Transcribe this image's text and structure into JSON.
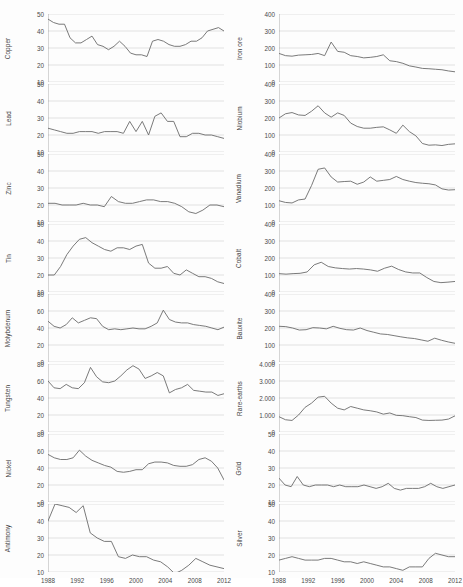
{
  "figure": {
    "title": "",
    "background": "#fdfdfd",
    "line_color": "#6b6b6b",
    "grid_color": "#d2d2d2",
    "axis_color": "#8a8a8a",
    "text_color": "#3f3f3f"
  },
  "axis": {
    "xticks": [
      "1988",
      "1992",
      "1996",
      "2000",
      "2004",
      "2008",
      "2012"
    ],
    "xmin": 1988,
    "xmax": 2012
  },
  "chart_data": [
    {
      "type": "line",
      "title": "Copper",
      "ylabel": "Copper",
      "xlabel": "",
      "grid": true,
      "legend": "none",
      "ylim": [
        10,
        50
      ],
      "yticks": [
        10,
        20,
        30,
        40,
        50
      ],
      "x": [
        1988,
        1989,
        1990,
        1991,
        1992,
        1993,
        1994,
        1995,
        1996,
        1997,
        1998,
        1999,
        2000,
        2001,
        2002,
        2003,
        2004,
        2005,
        2006,
        2007,
        2008,
        2009,
        2010,
        2011,
        2012
      ],
      "values": [
        47,
        45,
        44,
        44,
        36,
        33,
        33,
        35,
        37,
        32,
        31,
        29,
        31,
        34,
        31,
        27,
        26,
        26,
        25,
        34,
        35,
        34,
        32,
        31,
        31,
        32,
        34,
        34,
        36,
        40,
        41,
        42,
        40
      ]
    },
    {
      "type": "line",
      "title": "Lead",
      "ylabel": "Lead",
      "xlabel": "",
      "grid": true,
      "legend": "none",
      "ylim": [
        10,
        50
      ],
      "yticks": [
        10,
        20,
        30,
        40,
        50
      ],
      "x": [
        1988,
        1989,
        1990,
        1991,
        1992,
        1993,
        1994,
        1995,
        1996,
        1997,
        1998,
        1999,
        2000,
        2001,
        2002,
        2003,
        2004,
        2005,
        2006,
        2007,
        2008,
        2009,
        2010,
        2011,
        2012
      ],
      "values": [
        24,
        23,
        22,
        21,
        21,
        22,
        22,
        22,
        21,
        22,
        22,
        22,
        21,
        28,
        22,
        28,
        20,
        31,
        33,
        28,
        28,
        19,
        19,
        21,
        21,
        20,
        20,
        19,
        18
      ]
    },
    {
      "type": "line",
      "title": "Zinc",
      "ylabel": "Zinc",
      "xlabel": "",
      "grid": true,
      "legend": "none",
      "ylim": [
        10,
        50
      ],
      "yticks": [
        10,
        20,
        30,
        40,
        50
      ],
      "x": [
        1988,
        1989,
        1990,
        1991,
        1992,
        1993,
        1994,
        1995,
        1996,
        1997,
        1998,
        1999,
        2000,
        2001,
        2002,
        2003,
        2004,
        2005,
        2006,
        2007,
        2008,
        2009,
        2010,
        2011,
        2012
      ],
      "values": [
        21,
        21,
        20,
        20,
        20,
        21,
        20,
        20,
        19,
        25,
        22,
        21,
        21,
        22,
        23,
        23,
        22,
        22,
        21,
        19,
        16,
        15,
        17,
        20,
        20,
        19
      ]
    },
    {
      "type": "line",
      "title": "Tin",
      "ylabel": "Tin",
      "xlabel": "",
      "grid": true,
      "legend": "none",
      "ylim": [
        10,
        50
      ],
      "yticks": [
        10,
        20,
        30,
        40,
        50
      ],
      "x": [
        1988,
        1989,
        1990,
        1991,
        1992,
        1993,
        1994,
        1995,
        1996,
        1997,
        1998,
        1999,
        2000,
        2001,
        2002,
        2003,
        2004,
        2005,
        2006,
        2007,
        2008,
        2009,
        2010,
        2011,
        2012
      ],
      "values": [
        20,
        20,
        25,
        32,
        37,
        41,
        42,
        39,
        37,
        35,
        34,
        36,
        36,
        35,
        37,
        38,
        27,
        24,
        24,
        25,
        21,
        20,
        23,
        21,
        19,
        19,
        18,
        16,
        15
      ]
    },
    {
      "type": "line",
      "title": "Molybdenum",
      "ylabel": "Molybdenum",
      "xlabel": "",
      "grid": true,
      "legend": "none",
      "ylim": [
        0,
        80
      ],
      "yticks": [
        0,
        20,
        40,
        60,
        80
      ],
      "x": [
        1988,
        1989,
        1990,
        1991,
        1992,
        1993,
        1994,
        1995,
        1996,
        1997,
        1998,
        1999,
        2000,
        2001,
        2002,
        2003,
        2004,
        2005,
        2006,
        2007,
        2008,
        2009,
        2010,
        2011,
        2012
      ],
      "values": [
        48,
        42,
        40,
        44,
        52,
        46,
        49,
        52,
        51,
        42,
        38,
        39,
        38,
        39,
        40,
        39,
        39,
        42,
        46,
        61,
        50,
        47,
        46,
        46,
        44,
        43,
        42,
        40,
        38,
        41
      ]
    },
    {
      "type": "line",
      "title": "Tungsten",
      "ylabel": "Tungsten",
      "xlabel": "",
      "grid": true,
      "legend": "none",
      "ylim": [
        0,
        80
      ],
      "yticks": [
        0,
        20,
        40,
        60,
        80
      ],
      "x": [
        1988,
        1989,
        1990,
        1991,
        1992,
        1993,
        1994,
        1995,
        1996,
        1997,
        1998,
        1999,
        2000,
        2001,
        2002,
        2003,
        2004,
        2005,
        2006,
        2007,
        2008,
        2009,
        2010,
        2011,
        2012
      ],
      "values": [
        60,
        52,
        51,
        56,
        52,
        51,
        58,
        76,
        65,
        59,
        58,
        60,
        66,
        73,
        78,
        74,
        63,
        66,
        70,
        66,
        46,
        50,
        52,
        56,
        49,
        48,
        47,
        47,
        43,
        45
      ]
    },
    {
      "type": "line",
      "title": "Nickel",
      "ylabel": "Nickel",
      "xlabel": "",
      "grid": true,
      "legend": "none",
      "ylim": [
        0,
        80
      ],
      "yticks": [
        0,
        20,
        40,
        60,
        80
      ],
      "x": [
        1988,
        1989,
        1990,
        1991,
        1992,
        1993,
        1994,
        1995,
        1996,
        1997,
        1998,
        1999,
        2000,
        2001,
        2002,
        2003,
        2004,
        2005,
        2006,
        2007,
        2008,
        2009,
        2010,
        2011,
        2012
      ],
      "values": [
        56,
        52,
        50,
        50,
        52,
        61,
        54,
        49,
        46,
        43,
        41,
        36,
        35,
        36,
        38,
        38,
        45,
        47,
        47,
        46,
        43,
        42,
        42,
        44,
        50,
        52,
        48,
        40,
        26
      ]
    },
    {
      "type": "line",
      "title": "Antimony",
      "ylabel": "Antimony",
      "xlabel": "",
      "grid": true,
      "legend": "none",
      "ylim": [
        10,
        50
      ],
      "yticks": [
        10,
        20,
        30,
        40,
        50
      ],
      "x": [
        1988,
        1989,
        1990,
        1991,
        1992,
        1993,
        1994,
        1995,
        1996,
        1997,
        1998,
        1999,
        2000,
        2001,
        2002,
        2003,
        2004,
        2005,
        2006,
        2007,
        2008,
        2009,
        2010,
        2011,
        2012
      ],
      "values": [
        40,
        50,
        49,
        48,
        45,
        49,
        33,
        30,
        28,
        28,
        19,
        18,
        20,
        19,
        19,
        17,
        16,
        13,
        9,
        11,
        14,
        18,
        16,
        14,
        13,
        12
      ]
    },
    {
      "type": "line",
      "title": "Iron ore",
      "ylabel": "Iron ore",
      "xlabel": "",
      "grid": true,
      "legend": "none",
      "ylim": [
        0,
        400
      ],
      "yticks": [
        0,
        100,
        200,
        300,
        400
      ],
      "x": [
        1988,
        1989,
        1990,
        1991,
        1992,
        1993,
        1994,
        1995,
        1996,
        1997,
        1998,
        1999,
        2000,
        2001,
        2002,
        2003,
        2004,
        2005,
        2006,
        2007,
        2008,
        2009,
        2010,
        2011,
        2012
      ],
      "values": [
        168,
        155,
        152,
        158,
        160,
        162,
        168,
        155,
        235,
        180,
        175,
        155,
        150,
        142,
        145,
        150,
        160,
        125,
        120,
        110,
        95,
        88,
        80,
        78,
        75,
        72,
        65,
        60
      ]
    },
    {
      "type": "line",
      "title": "Niobium",
      "ylabel": "Niobium",
      "xlabel": "",
      "grid": true,
      "legend": "none",
      "ylim": [
        0,
        400
      ],
      "yticks": [
        0,
        100,
        200,
        300,
        400
      ],
      "x": [
        1988,
        1989,
        1990,
        1991,
        1992,
        1993,
        1994,
        1995,
        1996,
        1997,
        1998,
        1999,
        2000,
        2001,
        2002,
        2003,
        2004,
        2005,
        2006,
        2007,
        2008,
        2009,
        2010,
        2011,
        2012
      ],
      "values": [
        200,
        225,
        232,
        218,
        215,
        240,
        272,
        230,
        205,
        230,
        215,
        170,
        150,
        140,
        140,
        145,
        148,
        130,
        110,
        158,
        120,
        95,
        50,
        40,
        42,
        38,
        45,
        48
      ]
    },
    {
      "type": "line",
      "title": "Vanadium",
      "ylabel": "Vanadium",
      "xlabel": "",
      "grid": true,
      "legend": "none",
      "ylim": [
        0,
        400
      ],
      "yticks": [
        0,
        100,
        200,
        300,
        400
      ],
      "x": [
        1988,
        1989,
        1990,
        1991,
        1992,
        1993,
        1994,
        1995,
        1996,
        1997,
        1998,
        1999,
        2000,
        2001,
        2002,
        2003,
        2004,
        2005,
        2006,
        2007,
        2008,
        2009,
        2010,
        2011,
        2012
      ],
      "values": [
        125,
        115,
        112,
        130,
        135,
        215,
        310,
        318,
        265,
        235,
        238,
        240,
        222,
        235,
        265,
        240,
        245,
        250,
        268,
        250,
        240,
        232,
        228,
        225,
        218,
        195,
        188,
        190
      ]
    },
    {
      "type": "line",
      "title": "Cobalt",
      "ylabel": "Cobalt",
      "xlabel": "",
      "grid": true,
      "legend": "none",
      "ylim": [
        0,
        400
      ],
      "yticks": [
        0,
        100,
        200,
        300,
        400
      ],
      "x": [
        1988,
        1989,
        1990,
        1991,
        1992,
        1993,
        1994,
        1995,
        1996,
        1997,
        1998,
        1999,
        2000,
        2001,
        2002,
        2003,
        2004,
        2005,
        2006,
        2007,
        2008,
        2009,
        2010,
        2011,
        2012
      ],
      "values": [
        108,
        105,
        108,
        110,
        118,
        160,
        175,
        150,
        142,
        138,
        135,
        138,
        135,
        130,
        122,
        140,
        152,
        132,
        118,
        112,
        112,
        85,
        62,
        55,
        58,
        62
      ]
    },
    {
      "type": "line",
      "title": "Bauxite",
      "ylabel": "Bauxite",
      "xlabel": "",
      "grid": true,
      "legend": "none",
      "ylim": [
        0,
        400
      ],
      "yticks": [
        0,
        100,
        200,
        300,
        400
      ],
      "x": [
        1988,
        1989,
        1990,
        1991,
        1992,
        1993,
        1994,
        1995,
        1996,
        1997,
        1998,
        1999,
        2000,
        2001,
        2002,
        2003,
        2004,
        2005,
        2006,
        2007,
        2008,
        2009,
        2010,
        2011,
        2012
      ],
      "values": [
        210,
        208,
        200,
        188,
        190,
        202,
        200,
        195,
        210,
        198,
        190,
        188,
        200,
        185,
        175,
        165,
        162,
        155,
        148,
        142,
        138,
        130,
        122,
        140,
        128,
        118,
        110
      ]
    },
    {
      "type": "line",
      "title": "Rare-earths",
      "ylabel": "Rare-earths",
      "xlabel": "",
      "grid": true,
      "legend": "none",
      "ylim": [
        0,
        4000
      ],
      "yticks": [
        0,
        1000,
        2000,
        3000,
        4000
      ],
      "ytick_labels": [
        "0",
        "1.000",
        "2.000",
        "3.000",
        "4.000"
      ],
      "x": [
        1988,
        1989,
        1990,
        1991,
        1992,
        1993,
        1994,
        1995,
        1996,
        1997,
        1998,
        1999,
        2000,
        2001,
        2002,
        2003,
        2004,
        2005,
        2006,
        2007,
        2008,
        2009,
        2010,
        2011,
        2012
      ],
      "values": [
        900,
        720,
        680,
        1000,
        1450,
        1700,
        2050,
        2100,
        1700,
        1400,
        1300,
        1500,
        1400,
        1300,
        1250,
        1180,
        1050,
        1120,
        980,
        960,
        900,
        850,
        700,
        680,
        690,
        700,
        760,
        950
      ]
    },
    {
      "type": "line",
      "title": "Gold",
      "ylabel": "Gold",
      "xlabel": "",
      "grid": true,
      "legend": "none",
      "ylim": [
        10,
        50
      ],
      "yticks": [
        10,
        20,
        30,
        40,
        50
      ],
      "x": [
        1988,
        1989,
        1990,
        1991,
        1992,
        1993,
        1994,
        1995,
        1996,
        1997,
        1998,
        1999,
        2000,
        2001,
        2002,
        2003,
        2004,
        2005,
        2006,
        2007,
        2008,
        2009,
        2010,
        2011,
        2012
      ],
      "values": [
        24,
        20,
        19,
        25,
        20,
        19,
        20,
        20,
        20,
        19,
        20,
        19,
        19,
        19,
        20,
        19,
        18,
        19,
        21,
        18,
        17,
        18,
        18,
        18,
        19,
        21,
        19,
        18,
        19,
        20
      ]
    },
    {
      "type": "line",
      "title": "Silver",
      "ylabel": "Silver",
      "xlabel": "",
      "grid": true,
      "legend": "none",
      "ylim": [
        10,
        50
      ],
      "yticks": [
        10,
        20,
        30,
        40,
        50
      ],
      "x": [
        1988,
        1989,
        1990,
        1991,
        1992,
        1993,
        1994,
        1995,
        1996,
        1997,
        1998,
        1999,
        2000,
        2001,
        2002,
        2003,
        2004,
        2005,
        2006,
        2007,
        2008,
        2009,
        2010,
        2011,
        2012
      ],
      "values": [
        17,
        18,
        19,
        18,
        17,
        17,
        17,
        18,
        18,
        17,
        16,
        16,
        15,
        16,
        15,
        14,
        13,
        13,
        12,
        11,
        13,
        13,
        13,
        18,
        21,
        20,
        19,
        19
      ]
    }
  ]
}
